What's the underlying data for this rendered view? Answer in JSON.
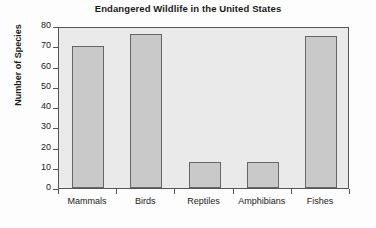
{
  "chart_data": {
    "type": "bar",
    "title": "Endangered Wildlife in the United States",
    "xlabel": "",
    "ylabel": "Number of Species",
    "categories": [
      "Mammals",
      "Birds",
      "Reptiles",
      "Amphibians",
      "Fishes"
    ],
    "values": [
      70,
      76,
      13,
      13,
      75
    ],
    "ylim": [
      0,
      80
    ],
    "ytick_values": [
      0,
      10,
      20,
      30,
      40,
      50,
      60,
      70,
      80
    ],
    "ytick_labels": [
      "0",
      "10",
      "20",
      "30",
      "40",
      "50",
      "60",
      "70",
      "80"
    ],
    "grid": false,
    "legend": "none",
    "colors": {
      "bar_fill": "#c9c9c9",
      "bar_border": "#666666",
      "plot_background": "#eaeaea",
      "axis": "#555555",
      "text": "#1a1a1a",
      "figure_background": "#fdfdfd"
    }
  }
}
